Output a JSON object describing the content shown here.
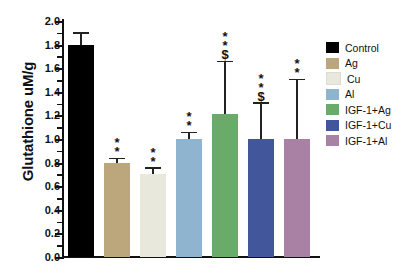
{
  "chart_data": {
    "type": "bar",
    "title": "",
    "xlabel": "",
    "ylabel": "Glutathione uM/g",
    "ylim": [
      0.0,
      2.0
    ],
    "ytick_step": 0.2,
    "ytick_labels": [
      "2.0",
      "1.8",
      "1.6",
      "1.4",
      "1.2",
      "1.0",
      "0.8",
      "0.6",
      "0.4",
      "0.2",
      "0.0"
    ],
    "grid": false,
    "legend_position": "right",
    "categories": [
      "Control",
      "Ag",
      "Cu",
      "Al",
      "IGF-1+Ag",
      "IGF-1+Cu",
      "IGF-1+Al"
    ],
    "values": [
      1.8,
      0.8,
      0.7,
      1.0,
      1.21,
      1.0,
      1.0
    ],
    "error_upper": [
      1.89,
      0.83,
      0.75,
      1.05,
      1.65,
      1.3,
      1.5
    ],
    "annotations": [
      "",
      "**",
      "**",
      "**",
      "$**",
      "$**",
      "**"
    ],
    "colors": [
      "#000000",
      "#bca77d",
      "#e8e8dc",
      "#8fb4d0",
      "#6aab6a",
      "#41569b",
      "#a881a5"
    ],
    "series": [
      {
        "name": "Control",
        "value": 1.8,
        "error_top": 1.89,
        "marks": [],
        "color": "#000000"
      },
      {
        "name": "Ag",
        "value": 0.8,
        "error_top": 0.83,
        "marks": [
          "*",
          "*"
        ],
        "color": "#bca77d"
      },
      {
        "name": "Cu",
        "value": 0.7,
        "error_top": 0.75,
        "marks": [
          "*",
          "*"
        ],
        "color": "#e8e8dc"
      },
      {
        "name": "Al",
        "value": 1.0,
        "error_top": 1.05,
        "marks": [
          "*",
          "*"
        ],
        "color": "#8fb4d0"
      },
      {
        "name": "IGF-1+Ag",
        "value": 1.21,
        "error_top": 1.65,
        "marks": [
          "$",
          "*",
          "*"
        ],
        "color": "#6aab6a"
      },
      {
        "name": "IGF-1+Cu",
        "value": 1.0,
        "error_top": 1.3,
        "marks": [
          "$",
          "*",
          "*"
        ],
        "color": "#41569b"
      },
      {
        "name": "IGF-1+Al",
        "value": 1.0,
        "error_top": 1.5,
        "marks": [
          "*",
          "*"
        ],
        "color": "#a881a5"
      }
    ]
  },
  "legend": {
    "items": [
      {
        "label": "Control",
        "color": "#000000"
      },
      {
        "label": "Ag",
        "color": "#bca77d"
      },
      {
        "label": "Cu",
        "color": "#e8e8dc"
      },
      {
        "label": "Al",
        "color": "#8fb4d0"
      },
      {
        "label": "IGF-1+Ag",
        "color": "#6aab6a"
      },
      {
        "label": "IGF-1+Cu",
        "color": "#41569b"
      },
      {
        "label": "IGF-1+Al",
        "color": "#a881a5"
      }
    ]
  }
}
